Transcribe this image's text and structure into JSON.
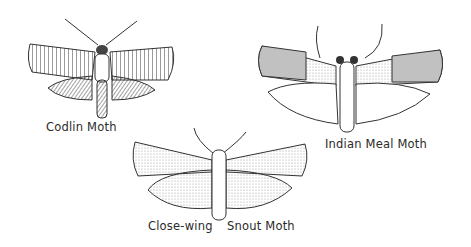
{
  "figure": {
    "moths": [
      {
        "id": "codlin",
        "label": "Codlin Moth"
      },
      {
        "id": "indian-meal",
        "label": "Indian Meal Moth"
      },
      {
        "id": "close-wing-snout",
        "label_left": "Close-wing",
        "label_right": "Snout Moth"
      }
    ],
    "colors": {
      "ink": "#2a2a2a",
      "paper": "#ffffff",
      "shade": "#8a8a8a"
    }
  }
}
